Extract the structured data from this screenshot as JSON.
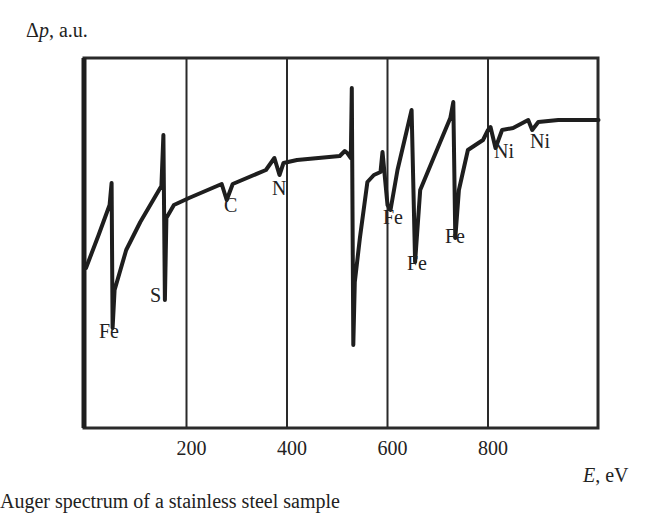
{
  "chart_data": {
    "type": "line",
    "title": "",
    "ylabel": "Δp, a.u.",
    "xlabel": "E, eV",
    "xlim": [
      0,
      1020
    ],
    "xticks": [
      200,
      400,
      600,
      800
    ],
    "xtick_labels": [
      "200",
      "400",
      "600",
      "800"
    ],
    "grid": "vertical lines at x ticks",
    "legend": null,
    "series": [
      {
        "name": "Δp spectrum",
        "points": [
          [
            0,
            268
          ],
          [
            25,
            235
          ],
          [
            47,
            205
          ],
          [
            51,
            183
          ],
          [
            53,
            328
          ],
          [
            57,
            290
          ],
          [
            80,
            250
          ],
          [
            108,
            222
          ],
          [
            150,
            186
          ],
          [
            154,
            135
          ],
          [
            157,
            300
          ],
          [
            160,
            218
          ],
          [
            175,
            205
          ],
          [
            205,
            198
          ],
          [
            270,
            184
          ],
          [
            280,
            200
          ],
          [
            292,
            184
          ],
          [
            358,
            170
          ],
          [
            375,
            158
          ],
          [
            385,
            175
          ],
          [
            393,
            163
          ],
          [
            420,
            160
          ],
          [
            505,
            156
          ],
          [
            515,
            151
          ],
          [
            520,
            153
          ],
          [
            527,
            158
          ],
          [
            529,
            88
          ],
          [
            532,
            345
          ],
          [
            535,
            282
          ],
          [
            545,
            238
          ],
          [
            560,
            182
          ],
          [
            573,
            175
          ],
          [
            586,
            172
          ],
          [
            590,
            152
          ],
          [
            600,
            205
          ],
          [
            606,
            210
          ],
          [
            620,
            170
          ],
          [
            648,
            110
          ],
          [
            655,
            262
          ],
          [
            665,
            190
          ],
          [
            690,
            160
          ],
          [
            725,
            118
          ],
          [
            731,
            102
          ],
          [
            735,
            238
          ],
          [
            742,
            190
          ],
          [
            760,
            150
          ],
          [
            790,
            140
          ],
          [
            800,
            130
          ],
          [
            805,
            127
          ],
          [
            815,
            148
          ],
          [
            828,
            130
          ],
          [
            850,
            128
          ],
          [
            880,
            120
          ],
          [
            888,
            130
          ],
          [
            900,
            122
          ],
          [
            940,
            120
          ],
          [
            1020,
            120
          ]
        ],
        "point_units": "[E_eV, pixel_y]"
      }
    ],
    "annotations": [
      {
        "text": "Fe",
        "x": 53,
        "label_x": 99,
        "label_y": 338
      },
      {
        "text": "S",
        "x": 157,
        "label_x": 150,
        "label_y": 302
      },
      {
        "text": "C",
        "x": 280,
        "label_x": 224,
        "label_y": 212
      },
      {
        "text": "N",
        "x": 385,
        "label_x": 272,
        "label_y": 195
      },
      {
        "text": "Fe",
        "x": 610,
        "label_x": 383,
        "label_y": 224
      },
      {
        "text": "Fe",
        "x": 655,
        "label_x": 407,
        "label_y": 270
      },
      {
        "text": "Fe",
        "x": 735,
        "label_x": 445,
        "label_y": 243
      },
      {
        "text": "Ni",
        "x": 815,
        "label_x": 494,
        "label_y": 158
      },
      {
        "text": "Ni",
        "x": 888,
        "label_x": 530,
        "label_y": 148
      }
    ]
  },
  "labels": {
    "y_axis_symbol": "Δ",
    "y_axis_var": "p",
    "y_axis_unit": ", a.u.",
    "x_axis_var": "E",
    "x_axis_unit": ", eV",
    "caption": "Auger spectrum of a stainless steel sample"
  }
}
